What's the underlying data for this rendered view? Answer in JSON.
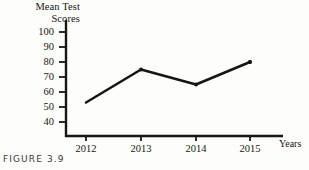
{
  "figure": {
    "caption": "FIGURE 3.9",
    "background_color": "#fdfdfb",
    "ink_color": "#161616"
  },
  "chart_data": {
    "type": "line",
    "title": "",
    "subtitle": "",
    "xlabel": "Years",
    "ylabel": "Mean Test Scores",
    "ylabel_lines": [
      "Mean Test",
      "Scores"
    ],
    "categories": [
      "2012",
      "2013",
      "2014",
      "2015"
    ],
    "x": [
      2012,
      2013,
      2014,
      2015
    ],
    "values": [
      53,
      75,
      65,
      80
    ],
    "series": [
      {
        "name": "Mean Test Scores",
        "values": [
          53,
          75,
          65,
          80
        ],
        "color": "#161616",
        "line_width": 2.6,
        "marker": "dot"
      }
    ],
    "ylim": [
      35,
      105
    ],
    "ytick_labels": [
      "100",
      "90",
      "80",
      "70",
      "60",
      "50",
      "40"
    ],
    "yticks": [
      100,
      90,
      80,
      70,
      60,
      50,
      40
    ],
    "xtick_labels": [
      "2012",
      "2013",
      "2014",
      "2015"
    ],
    "grid": false,
    "legend": "none",
    "axis_style": "open-L",
    "annotations": []
  }
}
